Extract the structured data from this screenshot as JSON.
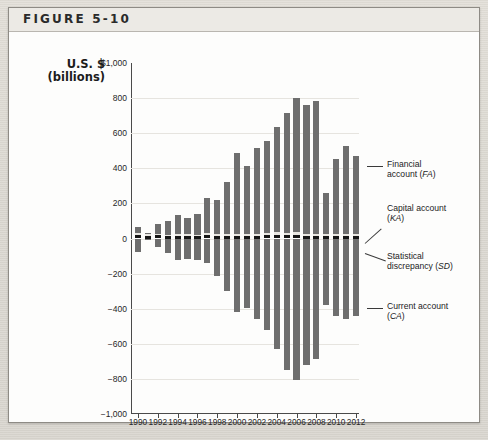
{
  "figure": {
    "label": "FIGURE 5-10"
  },
  "axis": {
    "y_title_line1": "U.S. $",
    "y_title_line2": "(billions)",
    "y_ticks": [
      "$1,000",
      "800",
      "600",
      "400",
      "200",
      "0",
      "−200",
      "−400",
      "−600",
      "−800",
      "−1,000"
    ],
    "x_ticks": [
      "1990",
      "1992",
      "1994",
      "1996",
      "1998",
      "2000",
      "2002",
      "2004",
      "2006",
      "2008",
      "2010",
      "2012"
    ]
  },
  "annotations": [
    {
      "id": "financial-account",
      "line1": "Financial",
      "line2": "account (",
      "abbr": "FA",
      "close": ")"
    },
    {
      "id": "capital-account",
      "line1": "Capital account",
      "line2": "(",
      "abbr": "KA",
      "close": ")"
    },
    {
      "id": "statistical-discrepancy",
      "line1": "Statistical",
      "line2": "discrepancy (",
      "abbr": "SD",
      "close": ")"
    },
    {
      "id": "current-account",
      "line1": "Current account",
      "line2": "(",
      "abbr": "CA",
      "close": ")"
    }
  ],
  "colors": {
    "financial_account": "#6e6e6e",
    "capital_account": "#e9e7e2",
    "statistical_discrepancy": "#161616",
    "current_account": "#6e6e6e",
    "axis": "#4a4a4a",
    "grid": "#e6e4df",
    "card": "#fdfdfc",
    "header": "#eceae5"
  },
  "chart_data": {
    "type": "bar",
    "title": "FIGURE 5-10",
    "subtitle": "U.S. Balance of Payments, 1990–2012",
    "xlabel": "",
    "ylabel": "U.S. $ (billions)",
    "ylim": [
      -1000,
      1000
    ],
    "ytick_step": 200,
    "grid": true,
    "stacked": true,
    "legend": "annotations at right",
    "x": [
      1990,
      1991,
      1992,
      1993,
      1994,
      1995,
      1996,
      1997,
      1998,
      1999,
      2000,
      2001,
      2002,
      2003,
      2004,
      2005,
      2006,
      2007,
      2008,
      2009,
      2010,
      2011,
      2012
    ],
    "categories": [
      "1990",
      "1991",
      "1992",
      "1993",
      "1994",
      "1995",
      "1996",
      "1997",
      "1998",
      "1999",
      "2000",
      "2001",
      "2002",
      "2003",
      "2004",
      "2005",
      "2006",
      "2007",
      "2008",
      "2009",
      "2010",
      "2011",
      "2012"
    ],
    "series": [
      {
        "name": "Financial account (FA)",
        "abbr": "FA",
        "color": "#6e6e6e",
        "values": [
          58,
          20,
          72,
          87,
          124,
          109,
          131,
          222,
          212,
          311,
          475,
          400,
          503,
          546,
          621,
          700,
          785,
          745,
          770,
          250,
          440,
          515,
          460
        ]
      },
      {
        "name": "Capital account (KA)",
        "abbr": "KA",
        "color": "#e9e7e2",
        "values": [
          10,
          10,
          10,
          10,
          10,
          10,
          10,
          10,
          10,
          10,
          12,
          12,
          12,
          12,
          14,
          14,
          14,
          14,
          14,
          12,
          12,
          12,
          12
        ]
      },
      {
        "name": "Statistical discrepancy (SD)",
        "abbr": "SD",
        "color": "#161616",
        "values": [
          20,
          14,
          18,
          12,
          16,
          14,
          12,
          22,
          16,
          14,
          12,
          14,
          16,
          18,
          22,
          20,
          24,
          12,
          14,
          12,
          16,
          14,
          12
        ]
      },
      {
        "name": "Current account (CA)",
        "abbr": "CA",
        "color": "#6e6e6e",
        "values": [
          -79,
          -3,
          -51,
          -85,
          -122,
          -114,
          -125,
          -141,
          -215,
          -301,
          -417,
          -398,
          -459,
          -522,
          -631,
          -749,
          -807,
          -719,
          -687,
          -381,
          -444,
          -459,
          -440
        ]
      }
    ]
  }
}
